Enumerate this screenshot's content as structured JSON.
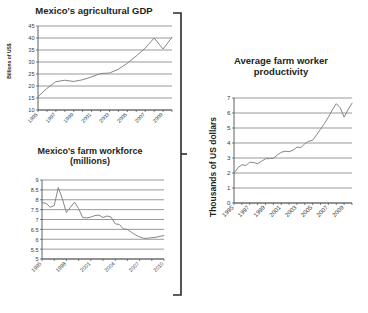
{
  "figure": {
    "background": "#ffffff",
    "line_color": "#808080",
    "axis_color": "#4d4d4d",
    "grid_color": "#6e6e6e",
    "bracket": {
      "name": "grouping-bracket",
      "orientation": "right-facing",
      "color": "#2b2b2b"
    }
  },
  "charts": [
    {
      "id": "agricultural-gdp",
      "title": "Mexico's agricultural GDP",
      "ylabel": "Billions of US$",
      "xlabel": "",
      "chart_data": {
        "type": "line",
        "title": "Mexico's agricultural GDP",
        "xlabel": "",
        "ylabel": "Billions of US$",
        "ylim": [
          10,
          45
        ],
        "yticks": [
          10,
          15,
          20,
          25,
          30,
          35,
          40,
          45
        ],
        "xlim": [
          1995,
          2010
        ],
        "xticks": [
          1995,
          1997,
          1999,
          2001,
          2003,
          2005,
          2007,
          2009
        ],
        "xtick_labels": [
          "1995",
          "1997",
          "1999",
          "2001",
          "2003",
          "2005",
          "2007",
          "2009"
        ],
        "grid": true,
        "x": [
          1995,
          1996,
          1997,
          1998,
          1999,
          2000,
          2001,
          2002,
          2003,
          2004,
          2005,
          2006,
          2007,
          2008,
          2009,
          2010
        ],
        "values": [
          15.5,
          19.0,
          21.8,
          22.4,
          21.9,
          22.6,
          23.8,
          25.2,
          25.4,
          27.0,
          29.5,
          32.5,
          35.8,
          40.0,
          35.4,
          40.3
        ],
        "series": [
          {
            "name": "Mexico's agricultural GDP",
            "values": [
              15.5,
              19.0,
              21.8,
              22.4,
              21.9,
              22.6,
              23.8,
              25.2,
              25.4,
              27.0,
              29.5,
              32.5,
              35.8,
              40.0,
              35.4,
              40.3
            ]
          }
        ]
      }
    },
    {
      "id": "farm-workforce",
      "title": "Mexico's farm workforce\n(millions)",
      "title_line1": "Mexico's farm workforce",
      "title_line2": "(millions)",
      "ylabel": "",
      "chart_data": {
        "type": "line",
        "title": "Mexico's farm workforce (millions)",
        "xlabel": "",
        "ylabel": "millions",
        "ylim": [
          5,
          9
        ],
        "yticks": [
          5,
          5.5,
          6,
          6.5,
          7,
          7.5,
          8,
          8.5,
          9
        ],
        "ytick_labels": [
          "5",
          "5.5",
          "6",
          "6.5",
          "7",
          "7.5",
          "8",
          "8.5",
          "9"
        ],
        "xlim": [
          1995,
          2010
        ],
        "xticks": [
          1995,
          1998,
          2001,
          2004,
          2007,
          2010
        ],
        "xtick_labels": [
          "1995",
          "1998",
          "2001",
          "2004",
          "2007",
          "2010"
        ],
        "grid": true,
        "x": [
          1995,
          1995.5,
          1996,
          1996.5,
          1997,
          1997.5,
          1998,
          1998.5,
          1999,
          1999.5,
          2000,
          2000.5,
          2001,
          2001.5,
          2002,
          2002.5,
          2003,
          2003.5,
          2004,
          2004.5,
          2005,
          2005.5,
          2006,
          2006.5,
          2007,
          2007.5,
          2008,
          2008.5,
          2009,
          2009.5,
          2010
        ],
        "values": [
          7.85,
          7.82,
          7.62,
          7.7,
          8.62,
          8.05,
          7.35,
          7.62,
          7.88,
          7.55,
          7.1,
          7.08,
          7.12,
          7.2,
          7.22,
          7.1,
          7.18,
          7.12,
          6.78,
          6.75,
          6.52,
          6.5,
          6.35,
          6.22,
          6.12,
          6.05,
          6.05,
          6.08,
          6.1,
          6.15,
          6.18
        ],
        "series": [
          {
            "name": "Mexico's farm workforce (millions)",
            "values": [
              7.85,
              7.82,
              7.62,
              7.7,
              8.62,
              8.05,
              7.35,
              7.62,
              7.88,
              7.55,
              7.1,
              7.08,
              7.12,
              7.2,
              7.22,
              7.1,
              7.18,
              7.12,
              6.78,
              6.75,
              6.52,
              6.5,
              6.35,
              6.22,
              6.12,
              6.05,
              6.05,
              6.08,
              6.1,
              6.15,
              6.18
            ]
          }
        ]
      }
    },
    {
      "id": "farm-worker-productivity",
      "title": "Average farm worker\nproductivity",
      "title_line1": "Average farm worker",
      "title_line2": "productivity",
      "ylabel": "Thousands of US dollars",
      "chart_data": {
        "type": "line",
        "title": "Average farm worker productivity",
        "xlabel": "",
        "ylabel": "Thousands of US dollars",
        "ylim": [
          0,
          7
        ],
        "yticks": [
          0,
          1,
          2,
          3,
          4,
          5,
          6,
          7
        ],
        "xlim": [
          1995,
          2010
        ],
        "xticks": [
          1995,
          1997,
          1999,
          2001,
          2003,
          2005,
          2007,
          2009
        ],
        "xtick_labels": [
          "1995",
          "1997",
          "1999",
          "2001",
          "2003",
          "2005",
          "2007",
          "2009"
        ],
        "grid": true,
        "x": [
          1995,
          1995.5,
          1996,
          1996.5,
          1997,
          1997.5,
          1998,
          1998.5,
          1999,
          1999.5,
          2000,
          2000.5,
          2001,
          2001.5,
          2002,
          2002.5,
          2003,
          2003.5,
          2004,
          2004.5,
          2005,
          2005.5,
          2006,
          2006.5,
          2007,
          2007.5,
          2008,
          2008.5,
          2009,
          2009.5,
          2010
        ],
        "values": [
          1.98,
          2.35,
          2.55,
          2.5,
          2.72,
          2.7,
          2.62,
          2.78,
          2.95,
          2.96,
          2.98,
          3.2,
          3.38,
          3.45,
          3.42,
          3.52,
          3.72,
          3.7,
          3.95,
          4.12,
          4.18,
          4.55,
          4.92,
          5.3,
          5.72,
          6.2,
          6.62,
          6.35,
          5.72,
          6.22,
          6.65
        ],
        "series": [
          {
            "name": "Average farm worker productivity",
            "values": [
              1.98,
              2.35,
              2.55,
              2.5,
              2.72,
              2.7,
              2.62,
              2.78,
              2.95,
              2.96,
              2.98,
              3.2,
              3.38,
              3.45,
              3.42,
              3.52,
              3.72,
              3.7,
              3.95,
              4.12,
              4.18,
              4.55,
              4.92,
              5.3,
              5.72,
              6.2,
              6.62,
              6.35,
              5.72,
              6.22,
              6.65
            ]
          }
        ]
      }
    }
  ]
}
